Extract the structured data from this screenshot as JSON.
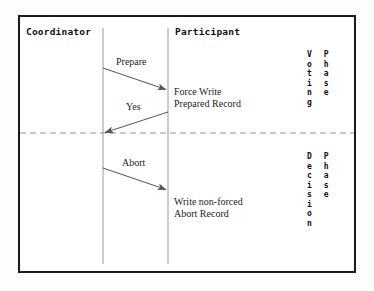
{
  "diagram": {
    "type": "sequence-diagram",
    "background_color": "#ffffff",
    "frame_color": "#1a1a1a",
    "lifeline_color": "#9a9a9a",
    "arrow_color": "#555555",
    "divider_color": "#8f8f9e",
    "actors": [
      {
        "id": "coordinator",
        "label": "Coordinator",
        "lifeline_x": 103
      },
      {
        "id": "participant",
        "label": "Participant",
        "lifeline_x": 168
      }
    ],
    "messages": [
      {
        "id": "prepare",
        "label": "Prepare",
        "from": "coordinator",
        "to": "participant",
        "direction": "right",
        "x1": 103,
        "y1": 68,
        "x2": 168,
        "y2": 90
      },
      {
        "id": "yes",
        "label": "Yes",
        "from": "participant",
        "to": "coordinator",
        "direction": "left",
        "x1": 168,
        "y1": 112,
        "x2": 103,
        "y2": 133
      },
      {
        "id": "abort",
        "label": "Abort",
        "from": "coordinator",
        "to": "participant",
        "direction": "right",
        "x1": 103,
        "y1": 168,
        "x2": 168,
        "y2": 190
      }
    ],
    "notes": [
      {
        "id": "prepared-record",
        "lines": [
          "Force Write",
          "Prepared Record"
        ]
      },
      {
        "id": "abort-record",
        "lines": [
          "Write non-forced",
          "Abort Record"
        ]
      }
    ],
    "phases": [
      {
        "id": "voting",
        "name_chars": [
          "V",
          "o",
          "t",
          "i",
          "n",
          "g"
        ],
        "suffix_chars": [
          "P",
          "h",
          "a",
          "s",
          "e"
        ]
      },
      {
        "id": "decision",
        "name_chars": [
          "D",
          "e",
          "c",
          "i",
          "s",
          "i",
          "o",
          "n"
        ],
        "suffix_chars": [
          "P",
          "h",
          "a",
          "s",
          "e"
        ]
      }
    ],
    "divider": {
      "id": "phase-divider",
      "y": 133,
      "style": "dashed"
    }
  }
}
